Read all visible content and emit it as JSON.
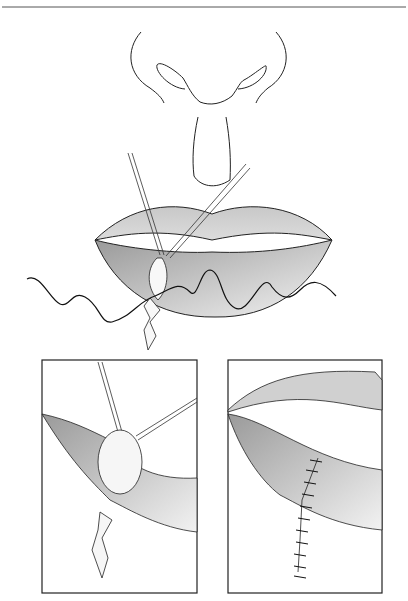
{
  "figure": {
    "type": "medical-illustration",
    "panels": [
      {
        "id": "main",
        "content": "nose and lips with wedge excision held by retractors, suture thread"
      },
      {
        "id": "inset-left",
        "content": "close-up of excised lesion with retractor hooks"
      },
      {
        "id": "inset-right",
        "content": "closed wound with interrupted sutures"
      }
    ],
    "colors": {
      "line": "#1a1a1a",
      "lip_dark": "#a8a8a8",
      "lip_light": "#e6e6e6",
      "rule": "#555555"
    }
  }
}
